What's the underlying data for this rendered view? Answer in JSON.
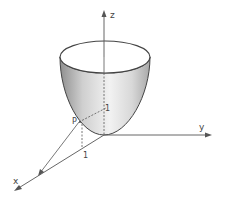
{
  "figure": {
    "type": "3d-surface-diagram",
    "surface": "paraboloid (bowl) opening upward, vertex at origin",
    "axes": {
      "x_label": "x",
      "y_label": "y",
      "z_label": "z"
    },
    "point_label": "P",
    "tick_labels": {
      "inner_one": "1",
      "x_axis_one": "1"
    },
    "colors": {
      "axis": "#555555",
      "outline": "#444444",
      "surface_light": "#f2f2f2",
      "surface_dark": "#8f8f8f",
      "background": "#ffffff"
    }
  }
}
